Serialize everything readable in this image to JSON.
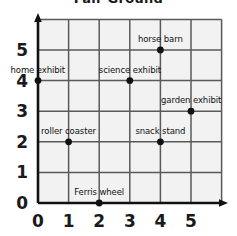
{
  "title": "Fair Ground",
  "colors": {
    "cell_fill": "#f2f2f2",
    "gridline": "#595959",
    "axis": "#111111",
    "point": "#111111",
    "text": "#111111"
  },
  "axes": {
    "x_ticks": [
      "0",
      "1",
      "2",
      "3",
      "4",
      "5"
    ],
    "y_ticks": [
      "0",
      "1",
      "2",
      "3",
      "4",
      "5"
    ],
    "xlabel": "",
    "ylabel": ""
  },
  "chart_data": {
    "type": "scatter",
    "title": "Fair Ground",
    "xlabel": "",
    "ylabel": "",
    "xlim": [
      0,
      6
    ],
    "ylim": [
      0,
      6
    ],
    "grid": true,
    "legend": "none",
    "x_ticks": [
      0,
      1,
      2,
      3,
      4,
      5
    ],
    "y_ticks": [
      0,
      1,
      2,
      3,
      4,
      5
    ],
    "points": [
      {
        "label": "home exhibit",
        "x": 0,
        "y": 4
      },
      {
        "label": "science exhibit",
        "x": 3,
        "y": 4
      },
      {
        "label": "horse barn",
        "x": 4,
        "y": 5
      },
      {
        "label": "garden exhibit",
        "x": 5,
        "y": 3
      },
      {
        "label": "roller coaster",
        "x": 1,
        "y": 2
      },
      {
        "label": "snack stand",
        "x": 4,
        "y": 2
      },
      {
        "label": "Ferris wheel",
        "x": 2,
        "y": 0
      }
    ]
  }
}
